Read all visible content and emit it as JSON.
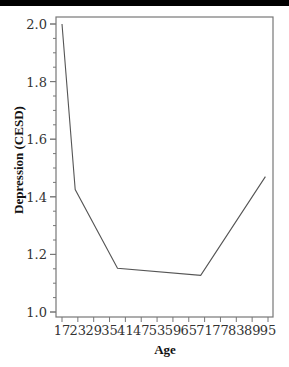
{
  "chart_data": {
    "type": "line",
    "title": "",
    "xlabel": "Age",
    "ylabel": "Depression (CESD)",
    "x_tick_labels": [
      "17",
      "23",
      "29",
      "35",
      "41",
      "47",
      "53",
      "59",
      "65",
      "71",
      "77",
      "83",
      "89",
      "95"
    ],
    "y_tick_labels": [
      "1.0",
      "1.2",
      "1.4",
      "1.6",
      "1.8",
      "2.0"
    ],
    "xlim": [
      17,
      95
    ],
    "ylim": [
      1.0,
      2.0
    ],
    "grid": false,
    "legend": null,
    "series": [
      {
        "name": "Depression (CESD)",
        "x": [
          17,
          22,
          38,
          69.5,
          94
        ],
        "y": [
          2.0,
          1.425,
          1.152,
          1.127,
          1.47
        ],
        "color": "#555555"
      }
    ]
  },
  "colors": {
    "topbar": "#000000",
    "axis": "#777777",
    "line": "#555555"
  }
}
